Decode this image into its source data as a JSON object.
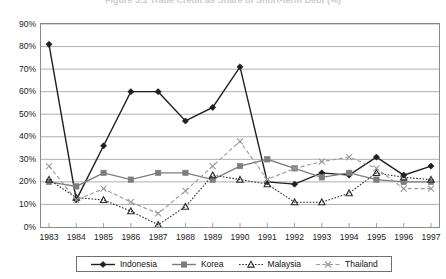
{
  "figure": {
    "title": "Figure 3.1  Trade Credit as Share of Short-term Debt (%)"
  },
  "axes": {
    "y_ticks": [
      "90%",
      "80%",
      "70%",
      "60%",
      "50%",
      "40%",
      "30%",
      "20%",
      "10%",
      "0%"
    ],
    "x_ticks": [
      "1983",
      "1984",
      "1985",
      "1986",
      "1987",
      "1988",
      "1989",
      "1990",
      "1991",
      "1992",
      "1993",
      "1994",
      "1995",
      "1996",
      "1997"
    ],
    "ymin": 0,
    "ymax": 90
  },
  "legend": {
    "items": [
      {
        "label": "Indonesia",
        "marker": "diamond",
        "dash": "solid",
        "color": "#1f1f1f"
      },
      {
        "label": "Korea",
        "marker": "square",
        "dash": "solid",
        "color": "#7d7d7d"
      },
      {
        "label": "Malaysia",
        "marker": "triangle",
        "dash": "dotted",
        "color": "#2b2b2b"
      },
      {
        "label": "Thailand",
        "marker": "cross",
        "dash": "dashed",
        "color": "#9a9a9a"
      }
    ]
  },
  "chart_data": {
    "type": "line",
    "title": "Figure 3.1  Trade Credit as Share of Short-term Debt (%)",
    "xlabel": "",
    "ylabel": "",
    "ylim": [
      0,
      90
    ],
    "ytick_interval": 10,
    "grid": "horizontal",
    "legend_position": "bottom",
    "categories": [
      "1983",
      "1984",
      "1985",
      "1986",
      "1987",
      "1988",
      "1989",
      "1990",
      "1991",
      "1992",
      "1993",
      "1994",
      "1995",
      "1996",
      "1997"
    ],
    "series": [
      {
        "name": "Indonesia",
        "marker": "diamond",
        "dash": "solid",
        "color": "#1f1f1f",
        "values": [
          81,
          12,
          36,
          60,
          60,
          47,
          53,
          71,
          20,
          19,
          24,
          23,
          31,
          23,
          27
        ]
      },
      {
        "name": "Korea",
        "marker": "square",
        "dash": "solid",
        "color": "#7d7d7d",
        "values": [
          20,
          18,
          24,
          21,
          24,
          24,
          21,
          27,
          30,
          26,
          22,
          24,
          21,
          20,
          20
        ]
      },
      {
        "name": "Malaysia",
        "marker": "triangle",
        "dash": "dotted",
        "color": "#2b2b2b",
        "values": [
          21,
          13,
          12,
          7,
          1,
          9,
          23,
          21,
          19,
          11,
          11,
          15,
          24,
          22,
          21
        ]
      },
      {
        "name": "Thailand",
        "marker": "cross",
        "dash": "dashed",
        "color": "#9a9a9a",
        "values": [
          27,
          12,
          17,
          11,
          6,
          16,
          27,
          38,
          21,
          26,
          29,
          31,
          26,
          17,
          17
        ]
      }
    ]
  }
}
